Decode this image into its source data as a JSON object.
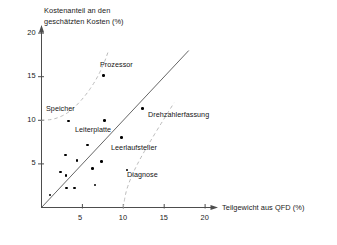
{
  "chart_data": {
    "type": "scatter",
    "title": "",
    "xlabel": "Teilgewicht aus QFD (%)",
    "ylabel": "Kostenanteil an den geschätzten Kosten (%)",
    "ylabel_line1": "Kostenanteil an den",
    "ylabel_line2": "geschätzten Kosten (%)",
    "xlim": [
      0,
      21.5
    ],
    "ylim": [
      0,
      21
    ],
    "xticks": [
      5,
      10,
      15,
      20
    ],
    "yticks": [
      5,
      10,
      15,
      20
    ],
    "xtick_labels": [
      "5",
      "10",
      "15",
      "20"
    ],
    "ytick_labels": [
      "5",
      "10",
      "15",
      "20"
    ],
    "grid": false,
    "legend": "none",
    "reference_line": {
      "name": "diagonal-identity-line",
      "style": "solid",
      "from": [
        0,
        0
      ],
      "to": [
        18,
        18
      ]
    },
    "boundary_curves": [
      {
        "name": "upper-boundary-curve",
        "style": "dashed",
        "points": [
          [
            0,
            10
          ],
          [
            1.6,
            10.1
          ],
          [
            3.4,
            10.9
          ],
          [
            5.2,
            12.6
          ],
          [
            6.6,
            14.5
          ],
          [
            7.6,
            16.4
          ],
          [
            8.2,
            18.0
          ]
        ]
      },
      {
        "name": "lower-boundary-curve",
        "style": "dashed",
        "points": [
          [
            10.0,
            0
          ],
          [
            10.3,
            1.8
          ],
          [
            11.0,
            3.6
          ],
          [
            12.0,
            5.5
          ],
          [
            13.3,
            7.6
          ],
          [
            14.8,
            9.9
          ],
          [
            16.2,
            12.0
          ]
        ]
      }
    ],
    "points": [
      {
        "label": "",
        "x": 1.05,
        "y": 1.45
      },
      {
        "label": "",
        "x": 2.35,
        "y": 4.05
      },
      {
        "label": "",
        "x": 2.95,
        "y": 6.0
      },
      {
        "label": "",
        "x": 3.0,
        "y": 3.65
      },
      {
        "label": "",
        "x": 3.05,
        "y": 2.25
      },
      {
        "label": "Speicher",
        "x": 3.3,
        "y": 9.9
      },
      {
        "label": "",
        "x": 4.05,
        "y": 2.25
      },
      {
        "label": "",
        "x": 4.35,
        "y": 5.4
      },
      {
        "label": "",
        "x": 5.6,
        "y": 7.15
      },
      {
        "label": "",
        "x": 6.2,
        "y": 4.45
      },
      {
        "label": "",
        "x": 6.55,
        "y": 2.6
      },
      {
        "label": "Leiterplatte",
        "x": 7.35,
        "y": 5.25
      },
      {
        "label": "",
        "x": 7.7,
        "y": 9.95
      },
      {
        "label": "Prozessor",
        "x": 7.6,
        "y": 15.15
      },
      {
        "label": "Leerlaufsteller",
        "x": 9.75,
        "y": 8.05
      },
      {
        "label": "Diagnose",
        "x": 10.45,
        "y": 4.3
      },
      {
        "label": "Drehzahlerfassung",
        "x": 12.35,
        "y": 11.35
      }
    ],
    "annotations": [
      {
        "text": "Prozessor",
        "x": 100,
        "y": 60
      },
      {
        "text": "Speicher",
        "x": 46,
        "y": 104
      },
      {
        "text": "Leiterplatte",
        "x": 75,
        "y": 125
      },
      {
        "text": "Drehzahlerfassung",
        "x": 148,
        "y": 110
      },
      {
        "text": "Leerlaufsteller",
        "x": 111,
        "y": 143
      },
      {
        "text": "Diagnose",
        "x": 127,
        "y": 170
      }
    ]
  },
  "colors": {
    "axis": "#4d4d4d",
    "point": "#000000",
    "reference_line": "#555555",
    "dashed_curve": "#bbbbbb",
    "text": "#1a1a1a",
    "background": "#ffffff"
  }
}
